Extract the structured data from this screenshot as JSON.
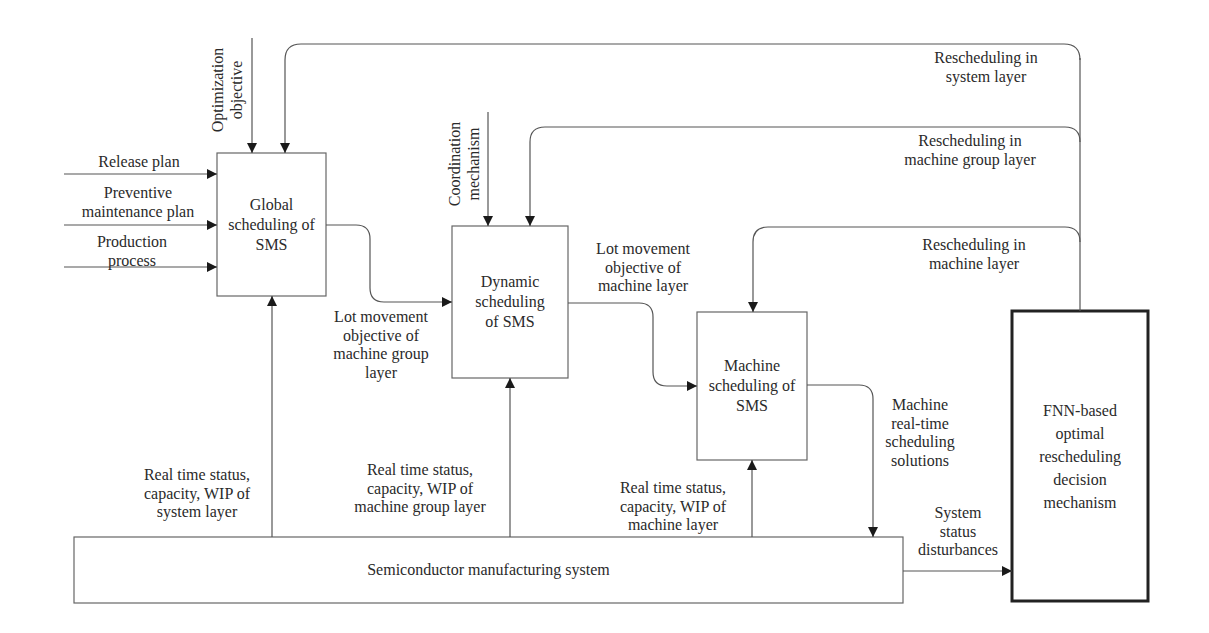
{
  "diagram": {
    "boxes": {
      "global": {
        "label": "Global\nscheduling of\nSMS"
      },
      "dynamic": {
        "label": "Dynamic\nscheduling\nof SMS"
      },
      "machine": {
        "label": "Machine\nscheduling of\nSMS"
      },
      "sms": {
        "label": "Semiconductor manufacturing system"
      },
      "fnn": {
        "label": "FNN-based\noptimal\nrescheduling\ndecision\nmechanism"
      }
    },
    "inputs": {
      "release_plan": "Release plan",
      "pm_plan": "Preventive\nmaintenance  plan",
      "production_process": "Production\nprocess",
      "optimization_objective": "Optimization\nobjective",
      "coordination_mechanism": "Coordination\nmechanism"
    },
    "flows": {
      "lot_mg": "Lot movement\nobjective of\nmachine group\nlayer",
      "lot_m": "Lot movement\nobjective of\nmachine layer",
      "machine_solutions": "Machine\nreal-time\nscheduling\nsolutions",
      "status_system": "Real time status,\ncapacity, WIP of\nsystem layer",
      "status_mg": "Real time status,\ncapacity, WIP of\nmachine group layer",
      "status_m": "Real time status,\ncapacity, WIP of\nmachine layer",
      "disturbances": "System\nstatus\ndisturbances"
    },
    "feedback": {
      "system_layer": "Rescheduling in\nsystem layer",
      "mg_layer": "Rescheduling in\nmachine group layer",
      "m_layer": "Rescheduling in\nmachine layer"
    },
    "colors": {
      "line": "#555555",
      "box_border": "#666666",
      "fnn_border": "#222222",
      "text": "#2a2a2a",
      "background": "#ffffff"
    }
  }
}
